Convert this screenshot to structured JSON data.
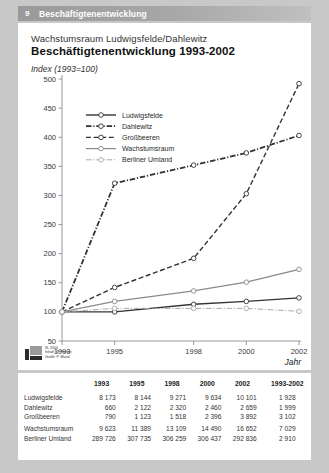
{
  "header": {
    "number": "9",
    "title": "Beschäftigtenentwicklung"
  },
  "titles": {
    "subtitle": "Wachstumsraum Ludwigsfelde/Dahlewitz",
    "main": "Beschäftigtenentwicklung 1993-2002",
    "index_note": "Index (1993=100)"
  },
  "credits": {
    "line1": "IfL 2004",
    "line2": "Inhalt: G. Herfert",
    "line3": "Grafik: P. Mund",
    "logo": "ifl-logo"
  },
  "source": "Quelle: Landesarbeitsamt Brandenburg",
  "axis": {
    "x_title": "Jahr"
  },
  "chart_data": {
    "type": "line",
    "title": "Beschäftigtenentwicklung 1993-2002",
    "subtitle": "Wachstumsraum Ludwigsfelde/Dahlewitz",
    "xlabel": "Jahr",
    "ylabel": "Index (1993=100)",
    "x": [
      "1993",
      "1995",
      "1998",
      "2000",
      "2002"
    ],
    "xticks": [
      "1993",
      "1995",
      "1998",
      "2000",
      "2002"
    ],
    "yticks": [
      50,
      100,
      150,
      200,
      250,
      300,
      350,
      400,
      450,
      500
    ],
    "ylim": [
      50,
      500
    ],
    "grid": false,
    "legend_position": "top-left",
    "marker": "open-circle",
    "series": [
      {
        "name": "Ludwigsfelde",
        "values": [
          100,
          100,
          113,
          118,
          124
        ],
        "color": "#333333",
        "style": "solid",
        "width": 1.4
      },
      {
        "name": "Dahlewitz",
        "values": [
          100,
          321,
          352,
          373,
          403
        ],
        "color": "#333333",
        "style": "dashdot",
        "width": 1.8
      },
      {
        "name": "Großbeeren",
        "values": [
          100,
          142,
          192,
          303,
          492
        ],
        "color": "#333333",
        "style": "dashed",
        "width": 1.4
      },
      {
        "name": "Wachstumsraum",
        "values": [
          100,
          118,
          136,
          151,
          173
        ],
        "color": "#8a8a8a",
        "style": "solid",
        "width": 1.2
      },
      {
        "name": "Berliner Umland",
        "values": [
          100,
          106,
          106,
          106,
          101
        ],
        "color": "#a8a8a8",
        "style": "dashdot",
        "width": 1.0
      }
    ]
  },
  "table": {
    "columns": [
      "",
      "1993",
      "1995",
      "1998",
      "2000",
      "2002",
      "1993-2002"
    ],
    "rows": [
      {
        "label": "Ludwigsfelde",
        "values": [
          "8 173",
          "8 144",
          "9 271",
          "9 634",
          "10 101",
          "1 928"
        ]
      },
      {
        "label": "Dahlewitz",
        "values": [
          "660",
          "2 122",
          "2 320",
          "2 460",
          "2 659",
          "1 999"
        ]
      },
      {
        "label": "Großbeeren",
        "values": [
          "790",
          "1 123",
          "1 518",
          "2 396",
          "3 892",
          "3 102"
        ]
      },
      {
        "label": "Wachstumsraum",
        "values": [
          "9 623",
          "11 389",
          "13 109",
          "14 490",
          "16 652",
          "7 029"
        ]
      },
      {
        "label": "Berliner Umland",
        "values": [
          "289 726",
          "307 735",
          "306 259",
          "306 437",
          "292 836",
          "2 910"
        ]
      }
    ]
  },
  "colors": {
    "page_bg": "#c8c8c8",
    "card_bg": "#ffffff",
    "header_bar": "#9a9a9a",
    "axis": "#8d8d8d",
    "dark_line": "#333333",
    "gray_line": "#8a8a8a",
    "light_line": "#a8a8a8"
  }
}
